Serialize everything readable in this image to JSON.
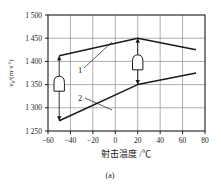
{
  "figure": {
    "caption": "(a)",
    "axis_color": "#1a1a1a",
    "grid_color": "#8c8c8c",
    "curve_color": "#1a1a1a"
  },
  "chart_data": {
    "type": "line",
    "title": "",
    "xlabel": "射击温度 /℃",
    "ylabel": "v0/(m·s-1)",
    "ylabel_main": "v",
    "ylabel_sub": "0",
    "ylabel_rest": "/(m·s",
    "ylabel_sup": "-1",
    "ylabel_tail": ")",
    "xlim": [
      -60,
      80
    ],
    "ylim": [
      1250,
      1500
    ],
    "xticks": [
      -60,
      -40,
      -20,
      0,
      20,
      40,
      60,
      80
    ],
    "xticklabels": [
      "-60",
      "-40",
      "-20",
      "0",
      "20",
      "40",
      "60",
      "80"
    ],
    "yticks": [
      1250,
      1300,
      1350,
      1400,
      1450,
      1500
    ],
    "yticklabels": [
      "1 250",
      "1 300",
      "1 350",
      "1 400",
      "1 450",
      "1 500"
    ],
    "grid": true,
    "legend": "inline-labels",
    "series": [
      {
        "name": "1",
        "label": "1",
        "x": [
          -50,
          20,
          72
        ],
        "values": [
          1412,
          1450,
          1425
        ]
      },
      {
        "name": "2",
        "label": "2",
        "x": [
          -50,
          20,
          72
        ],
        "values": [
          1272,
          1350,
          1375
        ]
      }
    ],
    "annotations": [
      {
        "name": "spread-arrow-minus50",
        "x": -50,
        "y_top": 1412,
        "y_bottom": 1272,
        "marker": "bullet",
        "marker_y": 1352
      },
      {
        "name": "spread-arrow-plus20",
        "x": 20,
        "y_top": 1450,
        "y_bottom": 1350,
        "marker": "bullet",
        "marker_y": 1398
      }
    ]
  }
}
